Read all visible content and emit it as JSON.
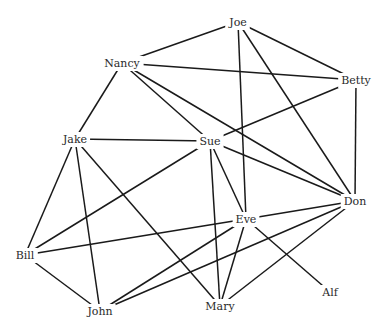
{
  "diagram": {
    "type": "network-graph",
    "nodes": [
      {
        "id": "Joe",
        "label": "Joe",
        "x": 238,
        "y": 22
      },
      {
        "id": "Nancy",
        "label": "Nancy",
        "x": 122,
        "y": 63
      },
      {
        "id": "Betty",
        "label": "Betty",
        "x": 356,
        "y": 80
      },
      {
        "id": "Jake",
        "label": "Jake",
        "x": 75,
        "y": 139
      },
      {
        "id": "Sue",
        "label": "Sue",
        "x": 210,
        "y": 141
      },
      {
        "id": "Don",
        "label": "Don",
        "x": 355,
        "y": 201
      },
      {
        "id": "Eve",
        "label": "Eve",
        "x": 246,
        "y": 219
      },
      {
        "id": "Bill",
        "label": "Bill",
        "x": 25,
        "y": 255
      },
      {
        "id": "Alf",
        "label": "Alf",
        "x": 330,
        "y": 292
      },
      {
        "id": "John",
        "label": "John",
        "x": 100,
        "y": 311
      },
      {
        "id": "Mary",
        "label": "Mary",
        "x": 220,
        "y": 306
      }
    ],
    "edges": [
      [
        "Joe",
        "Nancy"
      ],
      [
        "Joe",
        "Betty"
      ],
      [
        "Joe",
        "Eve"
      ],
      [
        "Joe",
        "Don"
      ],
      [
        "Nancy",
        "Betty"
      ],
      [
        "Nancy",
        "Jake"
      ],
      [
        "Nancy",
        "Sue"
      ],
      [
        "Nancy",
        "Don"
      ],
      [
        "Betty",
        "Sue"
      ],
      [
        "Betty",
        "Don"
      ],
      [
        "Jake",
        "Sue"
      ],
      [
        "Jake",
        "Bill"
      ],
      [
        "Jake",
        "John"
      ],
      [
        "Jake",
        "Mary"
      ],
      [
        "Sue",
        "Don"
      ],
      [
        "Sue",
        "Eve"
      ],
      [
        "Sue",
        "Mary"
      ],
      [
        "Sue",
        "Bill"
      ],
      [
        "Eve",
        "Don"
      ],
      [
        "Eve",
        "Bill"
      ],
      [
        "Eve",
        "John"
      ],
      [
        "Eve",
        "Mary"
      ],
      [
        "Eve",
        "Alf"
      ],
      [
        "Don",
        "John"
      ],
      [
        "Don",
        "Mary"
      ],
      [
        "Bill",
        "John"
      ]
    ],
    "colors": {
      "edge": "#1a1a1a",
      "label": "#2a2a2a",
      "background": "#ffffff"
    }
  }
}
